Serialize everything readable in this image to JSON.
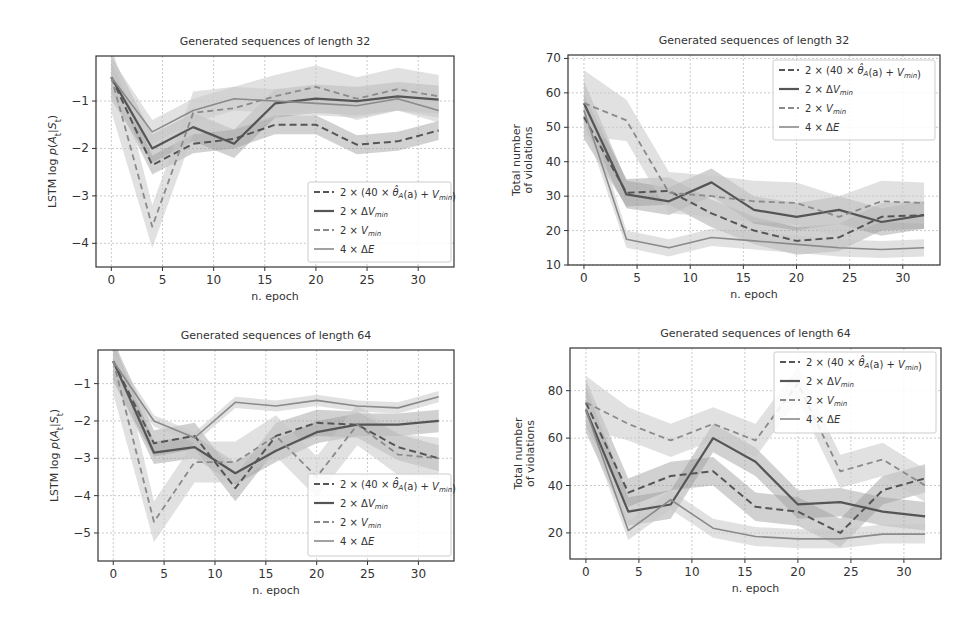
{
  "colors": {
    "dark_line": "#555555",
    "light_line": "#8a8a8a",
    "band_dark": "#9a9a9a",
    "band_light": "#c8c8c8",
    "grid": "#bdbdbd",
    "axis": "#333333"
  },
  "legend_labels": [
    "2 × (40 × θ̂_A(a) + V_min)",
    "2 × ΔV_min",
    "2 × V_min",
    "4 × ΔE"
  ],
  "chart_data": [
    {
      "id": "tl",
      "type": "line",
      "title": "Generated sequences of length 32",
      "xlabel": "n. epoch",
      "ylabel": "LSTM log p(A_t|S_t)",
      "xlim": [
        -1.5,
        33.5
      ],
      "ylim": [
        -4.5,
        -0.05
      ],
      "xticks": [
        0,
        5,
        10,
        15,
        20,
        25,
        30
      ],
      "yticks": [
        -4,
        -3,
        -2,
        -1
      ],
      "ytick_labels": [
        "−4",
        "−3",
        "−2",
        "−1"
      ],
      "grid": true,
      "legend_position": "lower right",
      "x": [
        0,
        4,
        8,
        12,
        16,
        20,
        24,
        28,
        32
      ],
      "series": [
        {
          "name": "2 × (40 × θ̂_A(a) + V_min)",
          "style": "dashed-dark",
          "values": [
            -0.5,
            -2.35,
            -1.9,
            -1.8,
            -1.5,
            -1.5,
            -1.92,
            -1.85,
            -1.62
          ],
          "band": 0.2
        },
        {
          "name": "2 × ΔV_min",
          "style": "solid-dark",
          "values": [
            -0.5,
            -2.0,
            -1.55,
            -1.9,
            -1.05,
            -0.95,
            -1.0,
            -0.9,
            -0.97
          ],
          "band": 0.3
        },
        {
          "name": "2 × V_min",
          "style": "dashed-light",
          "values": [
            -0.5,
            -3.65,
            -1.25,
            -1.15,
            -0.9,
            -0.7,
            -0.95,
            -0.75,
            -0.9
          ],
          "band": 0.45
        },
        {
          "name": "4 × ΔE",
          "style": "solid-light",
          "values": [
            -0.5,
            -1.65,
            -1.2,
            -0.95,
            -1.0,
            -1.05,
            -1.1,
            -0.95,
            -1.2
          ],
          "band": 0.25
        }
      ]
    },
    {
      "id": "tr",
      "type": "line",
      "title": "Generated sequences of length 32",
      "xlabel": "n. epoch",
      "ylabel": "Total number of violations",
      "ylabel_lines": [
        "Total number",
        "of violations"
      ],
      "xlim": [
        -1.5,
        33.5
      ],
      "ylim": [
        10,
        71
      ],
      "xticks": [
        0,
        5,
        10,
        15,
        20,
        25,
        30
      ],
      "yticks": [
        10,
        20,
        30,
        40,
        50,
        60,
        70
      ],
      "ytick_labels": [
        "10",
        "20",
        "30",
        "40",
        "50",
        "60",
        "70"
      ],
      "grid": true,
      "legend_position": "upper right",
      "x": [
        0,
        4,
        8,
        12,
        16,
        20,
        24,
        28,
        32
      ],
      "series": [
        {
          "name": "2 × (40 × θ̂_A(a) + V_min)",
          "style": "dashed-dark",
          "values": [
            53,
            31,
            31.5,
            25,
            20,
            17,
            18,
            24,
            24.5
          ],
          "band": 4
        },
        {
          "name": "2 × ΔV_min",
          "style": "solid-dark",
          "values": [
            57,
            30.5,
            28.5,
            34,
            26,
            24,
            26,
            22.5,
            24.5
          ],
          "band": 4
        },
        {
          "name": "2 × V_min",
          "style": "dashed-light",
          "values": [
            57,
            52,
            31,
            30,
            28.5,
            28,
            24,
            28.5,
            28
          ],
          "band": 6
        },
        {
          "name": "4 × ΔE",
          "style": "solid-light",
          "values": [
            55,
            17.5,
            15,
            18,
            17,
            16,
            15,
            14.5,
            15
          ],
          "band": 2.5
        }
      ]
    },
    {
      "id": "bl",
      "type": "line",
      "title": "Generated sequences of length 64",
      "xlabel": "n. epoch",
      "ylabel": "LSTM log p(A_t|S_t)",
      "xlim": [
        -1.5,
        33.5
      ],
      "ylim": [
        -5.75,
        -0.1
      ],
      "xticks": [
        0,
        5,
        10,
        15,
        20,
        25,
        30
      ],
      "yticks": [
        -5,
        -4,
        -3,
        -2,
        -1
      ],
      "ytick_labels": [
        "−5",
        "−4",
        "−3",
        "−2",
        "−1"
      ],
      "grid": true,
      "legend_position": "lower right",
      "x": [
        0,
        4,
        8,
        12,
        16,
        20,
        24,
        28,
        32
      ],
      "series": [
        {
          "name": "2 × (40 × θ̂_A(a) + V_min)",
          "style": "dashed-dark",
          "values": [
            -0.4,
            -2.6,
            -2.4,
            -3.8,
            -2.4,
            -2.05,
            -2.1,
            -2.7,
            -3.0
          ],
          "band": 0.35
        },
        {
          "name": "2 × ΔV_min",
          "style": "solid-dark",
          "values": [
            -0.4,
            -2.85,
            -2.7,
            -3.4,
            -2.8,
            -2.3,
            -2.1,
            -2.1,
            -2.0
          ],
          "band": 0.3
        },
        {
          "name": "2 × V_min",
          "style": "dashed-light",
          "values": [
            -0.4,
            -4.7,
            -3.1,
            -3.1,
            -2.4,
            -3.5,
            -2.1,
            -2.9,
            -3.0
          ],
          "band": 0.55
        },
        {
          "name": "4 × ΔE",
          "style": "solid-light",
          "values": [
            -0.4,
            -2.0,
            -2.45,
            -1.5,
            -1.6,
            -1.45,
            -1.6,
            -1.65,
            -1.35
          ],
          "band": 0.15
        }
      ]
    },
    {
      "id": "br",
      "type": "line",
      "title": "Generated sequences of length 64",
      "xlabel": "n. epoch",
      "ylabel": "Total number of violations",
      "ylabel_lines": [
        "Total number",
        "of violations"
      ],
      "xlim": [
        -1.5,
        33.5
      ],
      "ylim": [
        9,
        98
      ],
      "xticks": [
        0,
        5,
        10,
        15,
        20,
        25,
        30
      ],
      "yticks": [
        20,
        40,
        60,
        80
      ],
      "ytick_labels": [
        "20",
        "40",
        "60",
        "80"
      ],
      "grid": true,
      "legend_position": "upper right",
      "x": [
        0,
        4,
        8,
        12,
        16,
        20,
        24,
        28,
        32
      ],
      "series": [
        {
          "name": "2 × (40 × θ̂_A(a) + V_min)",
          "style": "dashed-dark",
          "values": [
            75,
            37,
            44,
            46,
            31,
            29,
            20,
            38,
            43
          ],
          "band": 6
        },
        {
          "name": "2 × ΔV_min",
          "style": "solid-dark",
          "values": [
            72,
            29,
            32,
            60,
            50,
            32,
            33,
            29,
            27
          ],
          "band": 6
        },
        {
          "name": "2 × V_min",
          "style": "dashed-light",
          "values": [
            75,
            66,
            59,
            66,
            59,
            83,
            46,
            51,
            40
          ],
          "band": 7
        },
        {
          "name": "4 × ΔE",
          "style": "solid-light",
          "values": [
            72,
            21,
            34,
            22,
            18.5,
            17.5,
            17.5,
            19.5,
            19.5
          ],
          "band": 4
        }
      ]
    }
  ],
  "layout": {
    "panels": [
      {
        "id": "tl",
        "left": 96,
        "top": 56,
        "width": 358,
        "height": 211,
        "title_y": 45,
        "legend": {
          "x": 308,
          "y": 182,
          "w": 143,
          "h": 80
        }
      },
      {
        "id": "tr",
        "left": 568,
        "top": 55,
        "width": 372,
        "height": 210,
        "title_y": 44,
        "legend": {
          "x": 773,
          "y": 60,
          "w": 162,
          "h": 80
        }
      },
      {
        "id": "bl",
        "left": 98,
        "top": 350,
        "width": 356,
        "height": 211,
        "title_y": 339,
        "legend": {
          "x": 308,
          "y": 474,
          "w": 143,
          "h": 82
        }
      },
      {
        "id": "br",
        "left": 570,
        "top": 348,
        "width": 371,
        "height": 211,
        "title_y": 337,
        "legend": {
          "x": 774,
          "y": 352,
          "w": 162,
          "h": 81
        }
      }
    ]
  }
}
